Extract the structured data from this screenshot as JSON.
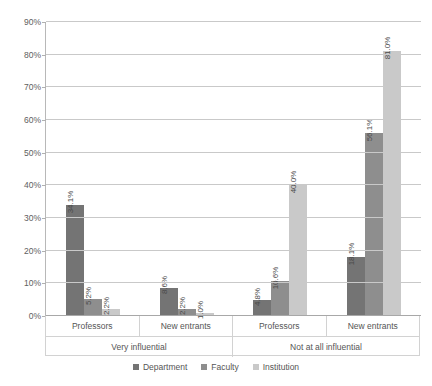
{
  "chart_data": {
    "type": "bar",
    "title": "",
    "xlabel": "",
    "ylabel": "",
    "ylim": [
      0,
      90
    ],
    "ytick_labels": [
      "0%",
      "10%",
      "20%",
      "30%",
      "40%",
      "50%",
      "60%",
      "70%",
      "80%",
      "90%"
    ],
    "ytick_values": [
      0,
      10,
      20,
      30,
      40,
      50,
      60,
      70,
      80,
      90
    ],
    "grid": true,
    "legend_position": "bottom",
    "categories": [
      "Professors",
      "New entrants",
      "Professors",
      "New entrants"
    ],
    "group_labels": [
      "Very influential",
      "Not at all influential"
    ],
    "series": [
      {
        "name": "Department",
        "color": "#747474",
        "values": [
          34.1,
          8.6,
          4.8,
          18.1
        ],
        "labels": [
          "34.1%",
          "8.6%",
          "4.8%",
          "18.1%"
        ]
      },
      {
        "name": "Faculty",
        "color": "#8e8e8e",
        "values": [
          5.2,
          2.2,
          10.6,
          56.1
        ],
        "labels": [
          "5.2%",
          "2.2%",
          "10.6%",
          "56.1%"
        ]
      },
      {
        "name": "Institution",
        "color": "#c9c9c9",
        "values": [
          2.2,
          1.0,
          40.0,
          81.0
        ],
        "labels": [
          "2.2%",
          "1.0%",
          "40.0%",
          "81.0%"
        ]
      }
    ]
  },
  "axis": {
    "ticks": [
      {
        "label": "90%",
        "value": 90
      },
      {
        "label": "80%",
        "value": 80
      },
      {
        "label": "70%",
        "value": 70
      },
      {
        "label": "60%",
        "value": 60
      },
      {
        "label": "50%",
        "value": 50
      },
      {
        "label": "40%",
        "value": 40
      },
      {
        "label": "30%",
        "value": 30
      },
      {
        "label": "20%",
        "value": 20
      },
      {
        "label": "10%",
        "value": 10
      },
      {
        "label": "0%",
        "value": 0
      }
    ]
  },
  "category_axis": {
    "tier1": [
      "Professors",
      "New entrants",
      "Professors",
      "New entrants"
    ],
    "tier2": [
      "Very influential",
      "Not at all influential"
    ]
  },
  "legend": {
    "items": [
      {
        "label": "Department",
        "color": "#747474"
      },
      {
        "label": "Faculty",
        "color": "#8e8e8e"
      },
      {
        "label": "Institution",
        "color": "#c9c9c9"
      }
    ]
  }
}
